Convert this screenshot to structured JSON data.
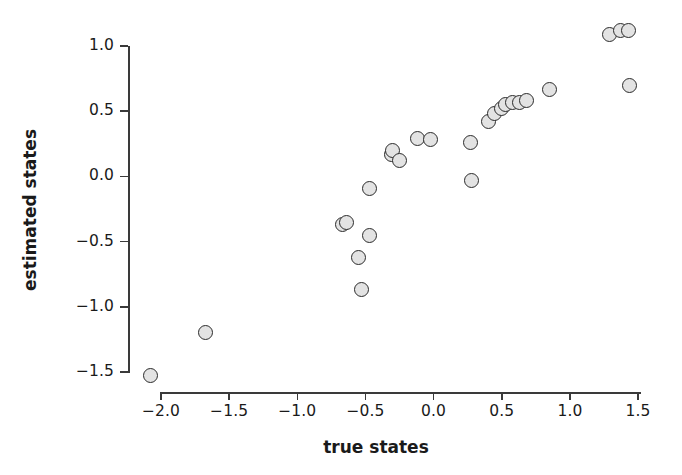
{
  "chart_data": {
    "type": "scatter",
    "title": "",
    "xlabel": "true states",
    "ylabel": "estimated states",
    "xlim": [
      -2.25,
      1.6
    ],
    "ylim": [
      -1.65,
      1.22
    ],
    "xticks": [
      -2.0,
      -1.5,
      -1.0,
      -0.5,
      0.0,
      0.5,
      1.0,
      1.5
    ],
    "xtick_labels": [
      "−2.0",
      "−1.5",
      "−1.0",
      "−0.5",
      "0.0",
      "0.5",
      "1.0",
      "1.5"
    ],
    "yticks": [
      1.0,
      0.5,
      0.0,
      -0.5,
      -1.0,
      -1.5
    ],
    "ytick_labels": [
      "1.0",
      "0.5",
      "0.0",
      "−0.5",
      "−1.0",
      "−1.5"
    ],
    "grid": false,
    "legend": null,
    "marker": {
      "shape": "circle",
      "fill_color": "#e3e3e3",
      "edge_color": "#2b2b2b",
      "size_px": 15
    },
    "series": [
      {
        "name": "estimated vs true states",
        "points": [
          {
            "x": -2.08,
            "y": -1.53
          },
          {
            "x": -1.67,
            "y": -1.2
          },
          {
            "x": -0.67,
            "y": -0.37
          },
          {
            "x": -0.64,
            "y": -0.35
          },
          {
            "x": -0.53,
            "y": -0.87
          },
          {
            "x": -0.55,
            "y": -0.62
          },
          {
            "x": -0.47,
            "y": -0.45
          },
          {
            "x": -0.47,
            "y": -0.09
          },
          {
            "x": -0.31,
            "y": 0.17
          },
          {
            "x": -0.3,
            "y": 0.2
          },
          {
            "x": -0.25,
            "y": 0.12
          },
          {
            "x": -0.12,
            "y": 0.29
          },
          {
            "x": -0.02,
            "y": 0.28
          },
          {
            "x": 0.28,
            "y": -0.03
          },
          {
            "x": 0.27,
            "y": 0.26
          },
          {
            "x": 0.4,
            "y": 0.42
          },
          {
            "x": 0.45,
            "y": 0.48
          },
          {
            "x": 0.5,
            "y": 0.52
          },
          {
            "x": 0.53,
            "y": 0.55
          },
          {
            "x": 0.58,
            "y": 0.57
          },
          {
            "x": 0.63,
            "y": 0.57
          },
          {
            "x": 0.68,
            "y": 0.58
          },
          {
            "x": 0.85,
            "y": 0.67
          },
          {
            "x": 1.29,
            "y": 1.09
          },
          {
            "x": 1.37,
            "y": 1.12
          },
          {
            "x": 1.43,
            "y": 1.12
          },
          {
            "x": 1.44,
            "y": 0.7
          }
        ]
      }
    ]
  },
  "axes": {
    "x_title": "true states",
    "y_title": "estimated states"
  }
}
